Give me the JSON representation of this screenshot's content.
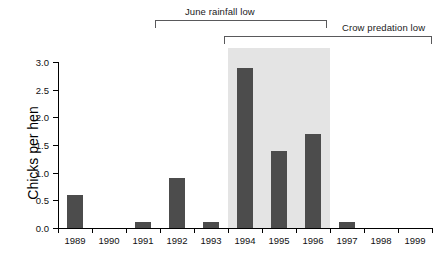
{
  "chart_data": {
    "type": "bar",
    "title": "",
    "subtitle": "",
    "xlabel": "",
    "ylabel": "Chicks per hen",
    "categories": [
      "1989",
      "1990",
      "1991",
      "1992",
      "1993",
      "1994",
      "1995",
      "1996",
      "1997",
      "1998",
      "1999"
    ],
    "values": [
      0.6,
      0.0,
      0.1,
      0.9,
      0.1,
      2.9,
      1.4,
      1.7,
      0.1,
      0.0,
      0.0
    ],
    "ylim": [
      0.0,
      3.0
    ],
    "ytick_labels": [
      "0.0",
      "0.5",
      "1.0",
      "1.5",
      "2.0",
      "2.5",
      "3.0"
    ],
    "ytick_values": [
      0.0,
      0.5,
      1.0,
      1.5,
      2.0,
      2.5,
      3.0
    ],
    "grid": false,
    "legend": null,
    "bar_color": "#4c4c4c",
    "shaded_band": {
      "label": "",
      "color": "#e4e4e4",
      "start_category": "1994",
      "end_category": "1996"
    },
    "annotations": [
      {
        "name": "june-rainfall-low",
        "text": "June rainfall low",
        "start_category": "1992",
        "end_category": "1996"
      },
      {
        "name": "crow-predation-low",
        "text": "Crow predation low",
        "start_category": "1994",
        "end_category": "1999"
      }
    ]
  },
  "annotation_brackets": {
    "upper": {
      "label": "June rainfall low"
    },
    "lower": {
      "label": "Crow predation low"
    }
  },
  "axes": {
    "y_title": "Chicks per hen"
  }
}
